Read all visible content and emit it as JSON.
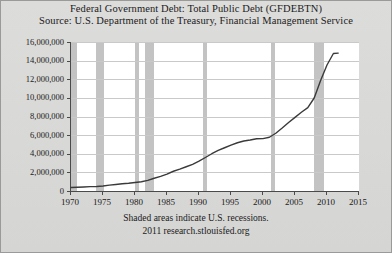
{
  "chart_data": {
    "type": "line",
    "title": "Federal Government Debt: Total Public Debt (GFDEBTN)",
    "subtitle": "Source: U.S. Department of the Treasury, Financial Management Service",
    "xlabel": "",
    "ylabel": "(Millions of dollars)",
    "xlim": [
      1970,
      2015
    ],
    "ylim": [
      0,
      16000000
    ],
    "grid": true,
    "legend": "none",
    "xticks": [
      1970,
      1975,
      1980,
      1985,
      1990,
      1995,
      2000,
      2005,
      2010,
      2015
    ],
    "xticklabels": [
      "1970",
      "1975",
      "1980",
      "1985",
      "1990",
      "1995",
      "2000",
      "2005",
      "2010",
      "2015"
    ],
    "yticks": [
      0,
      2000000,
      4000000,
      6000000,
      8000000,
      10000000,
      12000000,
      14000000,
      16000000
    ],
    "yticklabels": [
      "0",
      "2,000,000",
      "4,000,000",
      "6,000,000",
      "8,000,000",
      "10,000,000",
      "12,000,000",
      "14,000,000",
      "16,000,000"
    ],
    "series": [
      {
        "name": "Total Public Debt",
        "color": "#3a3a3a",
        "x": [
          1970,
          1971,
          1972,
          1973,
          1974,
          1975,
          1976,
          1977,
          1978,
          1979,
          1980,
          1981,
          1982,
          1983,
          1984,
          1985,
          1986,
          1987,
          1988,
          1989,
          1990,
          1991,
          1992,
          1993,
          1994,
          1995,
          1996,
          1997,
          1998,
          1999,
          2000,
          2001,
          2002,
          2003,
          2004,
          2005,
          2006,
          2007,
          2008,
          2009,
          2010,
          2011,
          2011.75
        ],
        "values": [
          380000,
          408000,
          436000,
          466000,
          484000,
          541000,
          629000,
          706000,
          777000,
          829000,
          909000,
          995000,
          1137000,
          1372000,
          1565000,
          1818000,
          2121000,
          2346000,
          2601000,
          2868000,
          3207000,
          3598000,
          4002000,
          4351000,
          4643000,
          4921000,
          5181000,
          5369000,
          5478000,
          5606000,
          5629000,
          5770000,
          6198000,
          6760000,
          7355000,
          7905000,
          8451000,
          8951000,
          9986000,
          11876000,
          13529000,
          14764000,
          14800000
        ]
      }
    ],
    "recession_bands": [
      {
        "start": 1970.0,
        "end": 1970.9
      },
      {
        "start": 1973.9,
        "end": 1975.2
      },
      {
        "start": 1980.0,
        "end": 1980.6
      },
      {
        "start": 1981.5,
        "end": 1982.9
      },
      {
        "start": 1990.6,
        "end": 1991.2
      },
      {
        "start": 2001.2,
        "end": 2001.9
      },
      {
        "start": 2007.9,
        "end": 2009.5
      }
    ],
    "annotations": {
      "footer_note": "Shaded areas indicate U.S. recessions.",
      "footer_source": "2011 research.stlouisfed.org"
    },
    "colors": {
      "background": "#d9d9d7",
      "plot_background": "#ffffff",
      "line": "#3a3a3a",
      "recession_band": "#c3c3c3",
      "gridline": "#c9c9c9",
      "axis": "#4a4a4a"
    }
  }
}
